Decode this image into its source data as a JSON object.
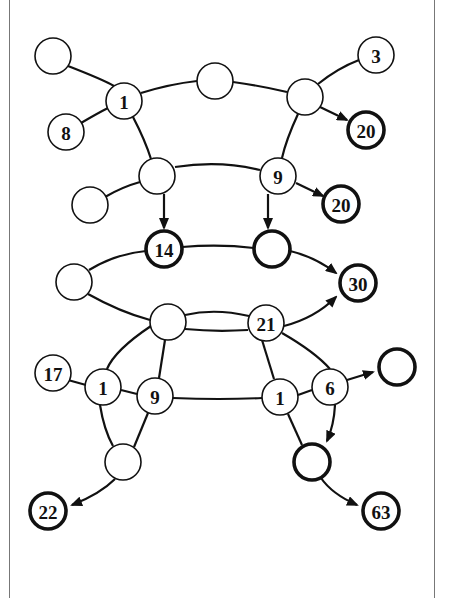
{
  "diagram": {
    "title": "",
    "colors": {
      "stroke": "#111111",
      "fill": "#ffffff",
      "frame": "#777777"
    },
    "nodes": [
      {
        "id": "n_tl",
        "label": "",
        "x": 53,
        "y": 56,
        "bold": false
      },
      {
        "id": "n_1a",
        "label": "1",
        "x": 124,
        "y": 101,
        "bold": false
      },
      {
        "id": "n_8",
        "label": "8",
        "x": 66,
        "y": 132,
        "bold": false
      },
      {
        "id": "n_tm",
        "label": "",
        "x": 215,
        "y": 81,
        "bold": false
      },
      {
        "id": "n_tr",
        "label": "",
        "x": 305,
        "y": 97,
        "bold": false
      },
      {
        "id": "n_3",
        "label": "3",
        "x": 376,
        "y": 55,
        "bold": false
      },
      {
        "id": "n_20a",
        "label": "20",
        "x": 366,
        "y": 130,
        "bold": true
      },
      {
        "id": "n_m2",
        "label": "",
        "x": 157,
        "y": 176,
        "bold": false
      },
      {
        "id": "n_l2",
        "label": "",
        "x": 90,
        "y": 205,
        "bold": false
      },
      {
        "id": "n_9a",
        "label": "9",
        "x": 278,
        "y": 176,
        "bold": false
      },
      {
        "id": "n_20b",
        "label": "20",
        "x": 341,
        "y": 204,
        "bold": true
      },
      {
        "id": "n_14",
        "label": "14",
        "x": 164,
        "y": 249,
        "bold": true
      },
      {
        "id": "n_b3",
        "label": "",
        "x": 272,
        "y": 249,
        "bold": true
      },
      {
        "id": "n_l3",
        "label": "",
        "x": 74,
        "y": 282,
        "bold": false
      },
      {
        "id": "n_30",
        "label": "30",
        "x": 358,
        "y": 283,
        "bold": true
      },
      {
        "id": "n_m4",
        "label": "",
        "x": 168,
        "y": 322,
        "bold": false
      },
      {
        "id": "n_21",
        "label": "21",
        "x": 266,
        "y": 323,
        "bold": false
      },
      {
        "id": "n_17",
        "label": "17",
        "x": 53,
        "y": 373,
        "bold": false
      },
      {
        "id": "n_1b",
        "label": "1",
        "x": 103,
        "y": 387,
        "bold": false
      },
      {
        "id": "n_9b",
        "label": "9",
        "x": 155,
        "y": 396,
        "bold": false
      },
      {
        "id": "n_1c",
        "label": "1",
        "x": 280,
        "y": 397,
        "bold": false
      },
      {
        "id": "n_6",
        "label": "6",
        "x": 330,
        "y": 387,
        "bold": false
      },
      {
        "id": "n_br",
        "label": "",
        "x": 397,
        "y": 367,
        "bold": true
      },
      {
        "id": "n_bl",
        "label": "",
        "x": 123,
        "y": 462,
        "bold": false
      },
      {
        "id": "n_bb",
        "label": "",
        "x": 312,
        "y": 462,
        "bold": true
      },
      {
        "id": "n_22",
        "label": "22",
        "x": 48,
        "y": 511,
        "bold": true
      },
      {
        "id": "n_63",
        "label": "63",
        "x": 381,
        "y": 511,
        "bold": true
      }
    ],
    "edges": [
      {
        "d": "M68,66 Q104,80 114,86",
        "arrow": false
      },
      {
        "d": "M81,123 Q98,113 108,108",
        "arrow": false
      },
      {
        "d": "M141,93 Q170,84 197,81",
        "arrow": false
      },
      {
        "d": "M233,82 Q262,86 287,92",
        "arrow": false
      },
      {
        "d": "M318,84 Q338,68 359,60",
        "arrow": false
      },
      {
        "d": "M133,117 Q145,140 151,159",
        "arrow": false
      },
      {
        "d": "M298,114 Q286,140 282,158",
        "arrow": false
      },
      {
        "d": "M105,197 Q122,187 140,182",
        "arrow": false
      },
      {
        "d": "M175,167 Q220,160 260,170",
        "arrow": false
      },
      {
        "d": "M320,107 L347,120",
        "arrow": true
      },
      {
        "d": "M296,183 L323,196",
        "arrow": true
      },
      {
        "d": "M164,194 L164,228",
        "arrow": true
      },
      {
        "d": "M268,194 L268,228",
        "arrow": true
      },
      {
        "d": "M182,247 Q220,244 254,248",
        "arrow": false
      },
      {
        "d": "M89,270 Q115,254 146,251",
        "arrow": false
      },
      {
        "d": "M290,251 Q315,257 336,273",
        "arrow": true
      },
      {
        "d": "M88,294 Q120,312 150,320",
        "arrow": false
      },
      {
        "d": "M185,315 Q215,308 249,316",
        "arrow": false
      },
      {
        "d": "M185,329 Q215,332 248,330",
        "arrow": false
      },
      {
        "d": "M284,326 Q315,318 336,297",
        "arrow": true
      },
      {
        "d": "M282,333 Q315,352 330,369",
        "arrow": false
      },
      {
        "d": "M151,326 Q115,350 107,369",
        "arrow": false
      },
      {
        "d": "M165,340 L159,378",
        "arrow": false
      },
      {
        "d": "M68,380 L86,385",
        "arrow": false
      },
      {
        "d": "M121,390 L137,394",
        "arrow": false
      },
      {
        "d": "M173,398 Q220,400 262,398",
        "arrow": false
      },
      {
        "d": "M262,340 L274,379",
        "arrow": false
      },
      {
        "d": "M298,395 L312,390",
        "arrow": false
      },
      {
        "d": "M100,405 Q104,430 113,446",
        "arrow": false
      },
      {
        "d": "M148,413 L134,447",
        "arrow": false
      },
      {
        "d": "M288,414 L302,445",
        "arrow": false
      },
      {
        "d": "M347,380 L373,372",
        "arrow": true
      },
      {
        "d": "M335,405 Q334,425 327,441",
        "arrow": true
      },
      {
        "d": "M115,479 Q100,494 72,505",
        "arrow": true
      },
      {
        "d": "M321,478 Q332,494 357,505",
        "arrow": true
      }
    ]
  }
}
